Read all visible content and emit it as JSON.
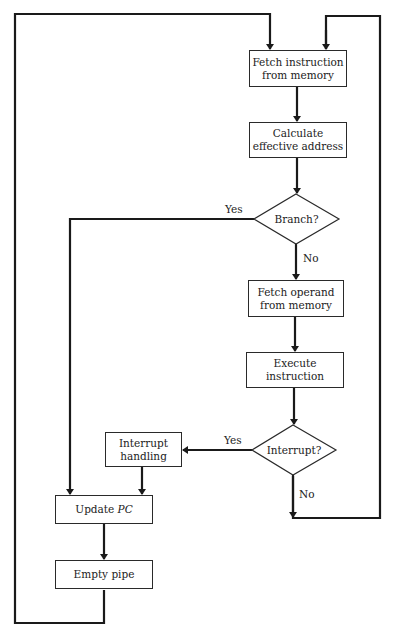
{
  "diagram": {
    "type": "flowchart",
    "nodes": {
      "fetch_instruction": {
        "line1": "Fetch instruction",
        "line2": "from memory"
      },
      "calc_address": {
        "line1": "Calculate",
        "line2": "effective address"
      },
      "branch": {
        "label": "Branch?"
      },
      "fetch_operand": {
        "line1": "Fetch operand",
        "line2": "from memory"
      },
      "execute": {
        "label": "Execute instruction"
      },
      "interrupt": {
        "label": "Interrupt?"
      },
      "interrupt_handling": {
        "line1": "Interrupt",
        "line2": "handling"
      },
      "update_pc": {
        "prefix": "Update ",
        "var": "PC"
      },
      "empty_pipe": {
        "label": "Empty pipe"
      }
    },
    "edge_labels": {
      "branch_yes": "Yes",
      "branch_no": "No",
      "interrupt_yes": "Yes",
      "interrupt_no": "No"
    },
    "edges": [
      {
        "from": "fetch_instruction",
        "to": "calc_address"
      },
      {
        "from": "calc_address",
        "to": "branch"
      },
      {
        "from": "branch",
        "to": "update_pc",
        "label": "Yes"
      },
      {
        "from": "branch",
        "to": "fetch_operand",
        "label": "No"
      },
      {
        "from": "fetch_operand",
        "to": "execute"
      },
      {
        "from": "execute",
        "to": "interrupt"
      },
      {
        "from": "interrupt",
        "to": "interrupt_handling",
        "label": "Yes"
      },
      {
        "from": "interrupt",
        "to": "fetch_instruction",
        "label": "No"
      },
      {
        "from": "interrupt_handling",
        "to": "update_pc"
      },
      {
        "from": "update_pc",
        "to": "empty_pipe"
      },
      {
        "from": "empty_pipe",
        "to": "fetch_instruction"
      }
    ],
    "colors": {
      "line": "#1a1a1a",
      "background": "#ffffff"
    }
  }
}
